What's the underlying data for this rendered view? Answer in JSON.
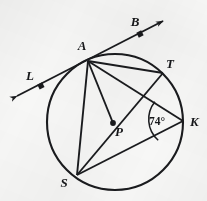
{
  "figure": {
    "background_color": "#f7f7f6",
    "ink_color": "#1a1b1e",
    "circle": {
      "center_label": "P",
      "cx": 115,
      "cy": 122,
      "r": 68
    },
    "points": [
      {
        "id": "A",
        "label": "A",
        "x": 88,
        "y": 61,
        "label_x": 82,
        "label_y": 50,
        "on_circle": true,
        "dot": false
      },
      {
        "id": "T",
        "label": "T",
        "x": 163,
        "y": 73,
        "label_x": 170,
        "label_y": 68,
        "on_circle": true,
        "dot": false
      },
      {
        "id": "K",
        "label": "K",
        "x": 183,
        "y": 121,
        "label_x": 190,
        "label_y": 126,
        "on_circle": true,
        "dot": false
      },
      {
        "id": "S",
        "label": "S",
        "x": 77,
        "y": 175,
        "label_x": 64,
        "label_y": 187,
        "on_circle": true,
        "dot": false
      },
      {
        "id": "P",
        "label": "P",
        "x": 113,
        "y": 123,
        "label_x": 119,
        "label_y": 136,
        "on_circle": false,
        "dot": true
      },
      {
        "id": "L",
        "label": "L",
        "x": 41,
        "y": 86,
        "label_x": 30,
        "label_y": 80,
        "on_circle": false,
        "dot": true
      },
      {
        "id": "B",
        "label": "B",
        "x": 140,
        "y": 34,
        "label_x": 135,
        "label_y": 26,
        "on_circle": false,
        "dot": true
      }
    ],
    "tangent_line": {
      "name": "LB",
      "through_point": "A",
      "start_x": 17,
      "start_y": 96,
      "end_x": 163,
      "end_y": 21,
      "arrow_both_ends": true
    },
    "chords": [
      {
        "name": "AT",
        "from": "A",
        "to": "T"
      },
      {
        "name": "AK",
        "from": "A",
        "to": "K"
      },
      {
        "name": "AS",
        "from": "A",
        "to": "S"
      },
      {
        "name": "AP",
        "from": "A",
        "to": "P"
      },
      {
        "name": "TS",
        "from": "T",
        "to": "S"
      },
      {
        "name": "SK",
        "from": "S",
        "to": "K"
      }
    ],
    "angles": [
      {
        "name": "angle-TKS",
        "vertex": "K",
        "value_text": "74°",
        "label_x": 157,
        "label_y": 125,
        "arc_radius": 28
      }
    ]
  }
}
